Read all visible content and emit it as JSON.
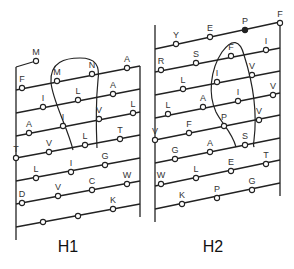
{
  "diagram": {
    "panels": [
      {
        "caption": "H1",
        "frame": {
          "left_x": 16,
          "right_x": 140,
          "left_top": 67,
          "left_bottom": 240,
          "right_top": 66,
          "right_bottom": 217
        },
        "top_stub": {
          "x1": 16,
          "y1": 67,
          "x2": 36,
          "y2": 61,
          "node": {
            "label": "M",
            "x": 36,
            "y": 61
          }
        },
        "lines": [
          {
            "y_left": 90,
            "y_right": 66,
            "nodes": [
              {
                "label": "F",
                "x": 22,
                "y": 88
              },
              {
                "label": "M",
                "x": 57,
                "y": 81
              },
              {
                "label": "N",
                "x": 92,
                "y": 74
              },
              {
                "label": "A",
                "x": 127,
                "y": 68
              }
            ]
          },
          {
            "y_left": 113,
            "y_right": 89,
            "nodes": [
              {
                "label": "I",
                "x": 43,
                "y": 107
              },
              {
                "label": "L",
                "x": 78,
                "y": 100
              },
              {
                "label": "A",
                "x": 113,
                "y": 94
              }
            ]
          },
          {
            "y_left": 136,
            "y_right": 112,
            "nodes": [
              {
                "label": "A",
                "x": 29,
                "y": 133
              },
              {
                "label": "I",
                "x": 63,
                "y": 126
              },
              {
                "label": "V",
                "x": 99,
                "y": 119
              },
              {
                "label": "L",
                "x": 133,
                "y": 113
              }
            ]
          },
          {
            "y_left": 158,
            "y_right": 135,
            "nodes": [
              {
                "label": "T",
                "x": 16,
                "y": 158
              },
              {
                "label": "V",
                "x": 49,
                "y": 152
              },
              {
                "label": "L",
                "x": 85,
                "y": 145
              },
              {
                "label": "T",
                "x": 120,
                "y": 139
              }
            ]
          },
          {
            "y_left": 181,
            "y_right": 158,
            "nodes": [
              {
                "label": "L",
                "x": 36,
                "y": 178
              },
              {
                "label": "I",
                "x": 71,
                "y": 172
              },
              {
                "label": "G",
                "x": 105,
                "y": 165
              }
            ]
          },
          {
            "y_left": 204,
            "y_right": 181,
            "nodes": [
              {
                "label": "D",
                "x": 22,
                "y": 203
              },
              {
                "label": "V",
                "x": 58,
                "y": 196
              },
              {
                "label": "C",
                "x": 92,
                "y": 190
              },
              {
                "label": "W",
                "x": 127,
                "y": 184
              }
            ]
          },
          {
            "y_left": 227,
            "y_right": 204,
            "nodes": [
              {
                "label": "",
                "x": 43,
                "y": 222
              },
              {
                "label": "",
                "x": 78,
                "y": 216
              },
              {
                "label": "K",
                "x": 113,
                "y": 209
              }
            ]
          }
        ],
        "loop_path": "M 73 150 C 68 128, 52 100, 51 82 C 50 62, 65 58, 80 58 C 96 58, 100 66, 98 80 C 96 100, 96 125, 97 148"
      },
      {
        "caption": "H2",
        "frame": {
          "left_x": 155,
          "right_x": 280,
          "left_top": 25,
          "left_bottom": 222,
          "right_top": 22,
          "right_bottom": 196
        },
        "lines": [
          {
            "y_left": 49,
            "y_right": 22,
            "nodes": [
              {
                "label": "Y",
                "x": 176,
                "y": 44
              },
              {
                "label": "E",
                "x": 210,
                "y": 37
              },
              {
                "label": "P",
                "x": 245,
                "y": 30,
                "filled": true
              },
              {
                "label": "F",
                "x": 280,
                "y": 23
              }
            ]
          },
          {
            "y_left": 72,
            "y_right": 48,
            "nodes": [
              {
                "label": "R",
                "x": 161,
                "y": 70
              },
              {
                "label": "S",
                "x": 196,
                "y": 63
              },
              {
                "label": "F",
                "x": 231,
                "y": 56
              },
              {
                "label": "I",
                "x": 266,
                "y": 50
              }
            ]
          },
          {
            "y_left": 95,
            "y_right": 71,
            "nodes": [
              {
                "label": "L",
                "x": 183,
                "y": 89
              },
              {
                "label": "I",
                "x": 217,
                "y": 82
              },
              {
                "label": "V",
                "x": 252,
                "y": 75
              }
            ]
          },
          {
            "y_left": 118,
            "y_right": 93,
            "nodes": [
              {
                "label": "L",
                "x": 168,
                "y": 114
              },
              {
                "label": "A",
                "x": 203,
                "y": 107
              },
              {
                "label": "I",
                "x": 238,
                "y": 101
              },
              {
                "label": "V",
                "x": 273,
                "y": 95
              }
            ]
          },
          {
            "y_left": 140,
            "y_right": 115,
            "nodes": [
              {
                "label": "V",
                "x": 155,
                "y": 140
              },
              {
                "label": "F",
                "x": 189,
                "y": 133
              },
              {
                "label": "P",
                "x": 224,
                "y": 126
              },
              {
                "label": "V",
                "x": 259,
                "y": 120
              }
            ]
          },
          {
            "y_left": 163,
            "y_right": 138,
            "nodes": [
              {
                "label": "G",
                "x": 175,
                "y": 159
              },
              {
                "label": "A",
                "x": 210,
                "y": 152
              },
              {
                "label": "S",
                "x": 245,
                "y": 145
              }
            ]
          },
          {
            "y_left": 186,
            "y_right": 160,
            "nodes": [
              {
                "label": "W",
                "x": 161,
                "y": 184
              },
              {
                "label": "L",
                "x": 196,
                "y": 178
              },
              {
                "label": "E",
                "x": 231,
                "y": 171
              },
              {
                "label": "T",
                "x": 266,
                "y": 164
              }
            ]
          },
          {
            "y_left": 209,
            "y_right": 183,
            "nodes": [
              {
                "label": "K",
                "x": 182,
                "y": 204
              },
              {
                "label": "P",
                "x": 217,
                "y": 198
              },
              {
                "label": "G",
                "x": 252,
                "y": 190
              }
            ]
          }
        ],
        "loop_path": "M 236 147 C 232 132, 222 124, 216 112 C 208 95, 210 70, 222 52 C 232 38, 240 40, 244 55 C 252 80, 258 108, 254 140 C 253 146, 254 148, 254 146"
      }
    ],
    "colors": {
      "line": "#222222",
      "node_fill": "#ffffff",
      "filled_node": "#222222",
      "label": "#333333"
    }
  }
}
